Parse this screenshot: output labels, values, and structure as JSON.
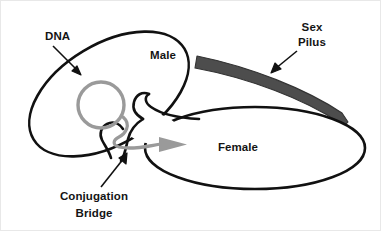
{
  "diagram": {
    "background_color": "#ffffff",
    "outline_color": "#111111",
    "plasmid_color": "#9a9a9a",
    "transfer_arrow_color": "#9a9a9a",
    "pilus_color": "#4d4d4d",
    "label_color": "#141414",
    "labels": {
      "dna": "DNA",
      "male": "Male",
      "sex_pilus_line1": "Sex",
      "sex_pilus_line2": "Pilus",
      "female": "Female",
      "conjugation_line1": "Conjugation",
      "conjugation_line2": "Bridge"
    },
    "parts": [
      {
        "name": "male-cell",
        "label": "Male",
        "shape": "tilted-ellipse"
      },
      {
        "name": "female-cell",
        "label": "Female",
        "shape": "horizontal-ellipse"
      },
      {
        "name": "plasmid-dna",
        "label": "DNA",
        "shape": "circle"
      },
      {
        "name": "sex-pilus",
        "label": "Sex Pilus",
        "shape": "curved-band"
      },
      {
        "name": "conjugation-bridge",
        "label": "Conjugation Bridge",
        "shape": "channel"
      },
      {
        "name": "dna-transfer-arrow",
        "label": "",
        "shape": "arrow"
      }
    ]
  }
}
